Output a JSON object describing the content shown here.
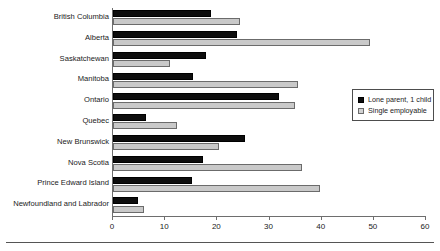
{
  "chart_data": {
    "type": "bar",
    "orientation": "horizontal",
    "title": "",
    "subtitle": "",
    "xlabel": "",
    "ylabel": "",
    "xlim": [
      0,
      60
    ],
    "xticks": [
      0,
      10,
      20,
      30,
      40,
      50,
      60
    ],
    "xtick_labels": [
      "0",
      "10",
      "20",
      "30",
      "40",
      "50",
      "60"
    ],
    "grid": false,
    "legend_position": "right",
    "categories": [
      "British Columbia",
      "Alberta",
      "Saskatchewan",
      "Manitoba",
      "Ontario",
      "Quebec",
      "New Brunswick",
      "Nova Scotia",
      "Prince Edward Island",
      "Newfoundland and Labrador"
    ],
    "series": [
      {
        "name": "Lone parent, 1 child",
        "color": "#0d0d0d",
        "values": [
          18.8,
          23.8,
          17.9,
          15.4,
          31.8,
          6.3,
          25.3,
          17.2,
          15.1,
          4.8
        ]
      },
      {
        "name": "Single employable",
        "color": "#c9c9c9",
        "values": [
          24.3,
          49.2,
          11.0,
          35.5,
          34.9,
          12.3,
          20.3,
          36.2,
          39.7,
          5.9
        ]
      }
    ]
  },
  "legend": {
    "entries": [
      {
        "label": "Lone parent, 1 child",
        "swatch": "black-square-swatch"
      },
      {
        "label": "Single employable",
        "swatch": "gray-square-swatch"
      }
    ]
  }
}
